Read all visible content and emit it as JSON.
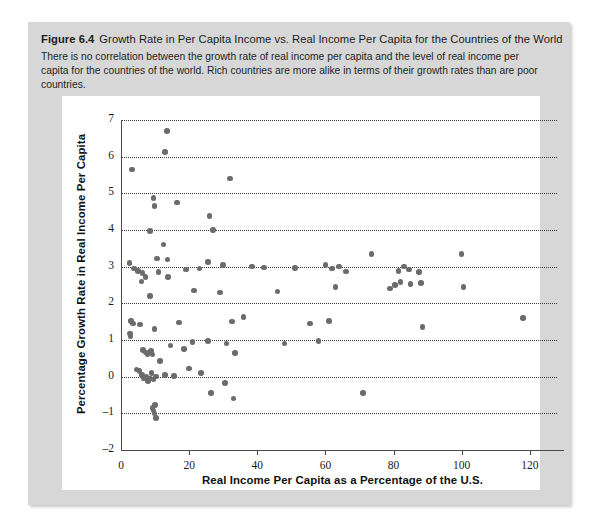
{
  "figure": {
    "number": "Figure 6.4",
    "title": "Growth Rate in Per Capita Income vs. Real Income Per Capita for the Countries of the World",
    "caption": "There is no correlation between the growth rate of real income per capita and the level of real income per capita for the countries of the world. Rich countries are more alike in terms of their growth rates than are poor countries.",
    "card_background": "#d7d7d7",
    "plot_background": "#ffffff",
    "point_color": "#6b6b6b"
  },
  "chart_data": {
    "type": "scatter",
    "title": "Growth Rate in Per Capita Income vs. Real Income Per Capita for the Countries of the World",
    "xlabel": "Real Income Per Capita as a Percentage of the U.S.",
    "ylabel": "Percentage Growth Rate in Real Income Per Capita",
    "xlim": [
      0,
      128
    ],
    "ylim": [
      -2,
      7
    ],
    "xticks": [
      0,
      20,
      40,
      60,
      80,
      100,
      120
    ],
    "yticks": [
      -2,
      -1,
      0,
      1,
      2,
      3,
      4,
      5,
      6,
      7
    ],
    "grid": "horizontal-dotted",
    "legend": null,
    "series": [
      {
        "name": "countries",
        "points": [
          [
            3.2,
            5.65
          ],
          [
            13.5,
            6.7
          ],
          [
            13.0,
            6.12
          ],
          [
            32.0,
            5.4
          ],
          [
            9.5,
            4.88
          ],
          [
            9.8,
            4.65
          ],
          [
            16.5,
            4.75
          ],
          [
            8.5,
            3.97
          ],
          [
            27.0,
            4.0
          ],
          [
            26.0,
            4.38
          ],
          [
            12.5,
            3.6
          ],
          [
            2.5,
            3.1
          ],
          [
            10.5,
            3.22
          ],
          [
            13.6,
            3.2
          ],
          [
            3.8,
            2.95
          ],
          [
            5.0,
            2.88
          ],
          [
            6.3,
            2.82
          ],
          [
            7.2,
            2.72
          ],
          [
            6.0,
            2.6
          ],
          [
            11.0,
            2.85
          ],
          [
            13.8,
            2.72
          ],
          [
            19.0,
            2.92
          ],
          [
            23.0,
            2.95
          ],
          [
            25.5,
            3.12
          ],
          [
            30.0,
            3.05
          ],
          [
            38.5,
            3.0
          ],
          [
            42.0,
            2.98
          ],
          [
            51.0,
            2.96
          ],
          [
            60.0,
            3.05
          ],
          [
            62.0,
            2.95
          ],
          [
            64.0,
            3.0
          ],
          [
            66.0,
            2.87
          ],
          [
            73.5,
            3.35
          ],
          [
            81.5,
            2.88
          ],
          [
            83.0,
            3.0
          ],
          [
            84.5,
            2.92
          ],
          [
            87.5,
            2.85
          ],
          [
            100.0,
            3.35
          ],
          [
            8.6,
            2.2
          ],
          [
            21.5,
            2.35
          ],
          [
            29.0,
            2.3
          ],
          [
            46.0,
            2.32
          ],
          [
            63.0,
            2.45
          ],
          [
            79.0,
            2.4
          ],
          [
            80.5,
            2.5
          ],
          [
            82.0,
            2.58
          ],
          [
            85.0,
            2.52
          ],
          [
            88.0,
            2.55
          ],
          [
            100.5,
            2.45
          ],
          [
            3.0,
            1.52
          ],
          [
            3.6,
            1.45
          ],
          [
            5.5,
            1.42
          ],
          [
            2.6,
            1.18
          ],
          [
            2.8,
            1.1
          ],
          [
            9.8,
            1.3
          ],
          [
            17.0,
            1.48
          ],
          [
            32.5,
            1.5
          ],
          [
            36.0,
            1.62
          ],
          [
            55.5,
            1.45
          ],
          [
            61.0,
            1.52
          ],
          [
            88.5,
            1.35
          ],
          [
            118.0,
            1.6
          ],
          [
            6.5,
            0.72
          ],
          [
            7.3,
            0.66
          ],
          [
            7.8,
            0.62
          ],
          [
            8.8,
            0.7
          ],
          [
            9.3,
            0.6
          ],
          [
            14.5,
            0.85
          ],
          [
            18.5,
            0.75
          ],
          [
            21.0,
            0.95
          ],
          [
            25.5,
            0.98
          ],
          [
            31.0,
            0.9
          ],
          [
            33.5,
            0.65
          ],
          [
            48.0,
            0.9
          ],
          [
            58.0,
            0.98
          ],
          [
            4.5,
            0.2
          ],
          [
            5.4,
            0.15
          ],
          [
            6.2,
            0.05
          ],
          [
            6.8,
            -0.05
          ],
          [
            7.5,
            0.0
          ],
          [
            8.0,
            -0.12
          ],
          [
            8.6,
            -0.05
          ],
          [
            9.0,
            0.1
          ],
          [
            9.6,
            -0.08
          ],
          [
            10.2,
            0.0
          ],
          [
            11.5,
            0.42
          ],
          [
            13.0,
            0.05
          ],
          [
            15.5,
            0.02
          ],
          [
            20.0,
            0.22
          ],
          [
            23.5,
            0.1
          ],
          [
            26.5,
            -0.45
          ],
          [
            30.5,
            -0.18
          ],
          [
            33.0,
            -0.6
          ],
          [
            71.0,
            -0.45
          ],
          [
            9.2,
            -0.85
          ],
          [
            9.5,
            -0.92
          ],
          [
            9.8,
            -1.0
          ],
          [
            10.3,
            -1.12
          ],
          [
            10.0,
            -0.78
          ]
        ]
      }
    ]
  }
}
